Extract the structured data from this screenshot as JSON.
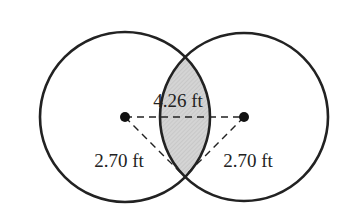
{
  "diagram": {
    "type": "overlapping-circles",
    "circles": [
      {
        "name": "left-circle",
        "cx": 125,
        "cy": 117,
        "r": 85
      },
      {
        "name": "right-circle",
        "cx": 244,
        "cy": 117,
        "r": 84
      }
    ],
    "centers": [
      {
        "name": "left-center",
        "x": 125,
        "y": 117
      },
      {
        "name": "right-center",
        "x": 244,
        "y": 117
      }
    ],
    "intersection_bottom": {
      "x": 184,
      "y": 176
    },
    "labels": {
      "center_distance": "4.26 ft",
      "left_radius": "2.70 ft",
      "right_radius": "2.70 ft"
    },
    "colors": {
      "stroke": "#222222",
      "shaded_region": "#cfcfcf",
      "background": "#ffffff"
    }
  }
}
